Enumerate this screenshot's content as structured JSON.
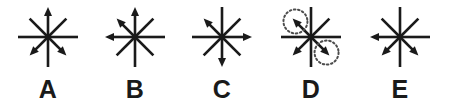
{
  "diagram": {
    "type": "arrow-star-multiple-choice",
    "background_color": "#ffffff",
    "stroke_color": "#1a1a1a",
    "label_color": "#1a1a1a",
    "highlight_color": "#4d4d4d",
    "ray_directions": [
      "N",
      "NE",
      "E",
      "SE",
      "S",
      "SW",
      "W",
      "NW"
    ],
    "axial_ray_length": 30,
    "diagonal_ray_length": 26,
    "stroke_width": 2.6,
    "arrowhead_length": 9,
    "arrowhead_width": 8,
    "center_y": 37,
    "figures": [
      {
        "label": "A",
        "center_x": 48,
        "arrow_directions": [
          "N",
          "SW",
          "SE"
        ],
        "highlighted_directions": []
      },
      {
        "label": "B",
        "center_x": 135,
        "arrow_directions": [
          "N",
          "NW",
          "W"
        ],
        "highlighted_directions": []
      },
      {
        "label": "C",
        "center_x": 222,
        "arrow_directions": [
          "NW",
          "E",
          "S"
        ],
        "highlighted_directions": []
      },
      {
        "label": "D",
        "center_x": 311,
        "arrow_directions": [
          "NW",
          "SW",
          "SE"
        ],
        "highlighted_directions": [
          "NW",
          "SE"
        ]
      },
      {
        "label": "E",
        "center_x": 400,
        "arrow_directions": [
          "W",
          "SW",
          "SE"
        ],
        "highlighted_directions": []
      }
    ]
  }
}
